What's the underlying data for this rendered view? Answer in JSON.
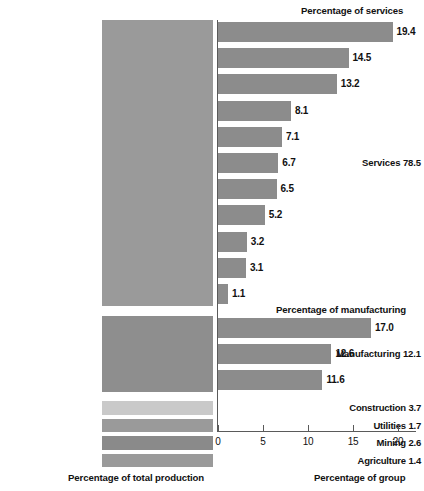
{
  "chart_data": {
    "type": "bar",
    "title": "",
    "orientation": "horizontal",
    "xlabel": "Percentage of group",
    "ylabel": "",
    "xlim": [
      0,
      22
    ],
    "xticks": [
      0,
      5,
      10,
      15,
      20
    ],
    "xtick_labels": [
      "0",
      "5",
      "10",
      "15",
      "20"
    ],
    "grid": false,
    "legend": false,
    "left_axis_title": "Percentage of total production",
    "right_axis_title": "Percentage of group",
    "sections": [
      {
        "name": "Services",
        "total": 78.5,
        "total_label": "Services 78.5",
        "header": "Percentage of services",
        "categories": [
          "Healthcare",
          "Real estate",
          "Professional and\nbusiness services",
          "Finance and insurance",
          "Education",
          "Wholesale trade",
          "Retail trade",
          "Information",
          "Transportation",
          "Accommodation\nand food services",
          "Arts, entertainment,\nand recreation"
        ],
        "values": [
          19.4,
          14.5,
          13.2,
          8.1,
          7.1,
          6.7,
          6.5,
          5.2,
          3.2,
          3.1,
          1.1
        ],
        "value_labels": [
          "19.4",
          "14.5",
          "13.2",
          "8.1",
          "7.1",
          "6.7",
          "6.5",
          "5.2",
          "3.2",
          "3.1",
          "1.1"
        ]
      },
      {
        "name": "Manufacturing",
        "total": 12.1,
        "total_label": "Manufacturing 12.1",
        "header": "Percentage of manufacturing",
        "categories": [
          "Chemicals",
          "Computers",
          "Food and drink"
        ],
        "values": [
          17.0,
          12.6,
          11.6
        ],
        "value_labels": [
          "17.0",
          "12.6",
          "11.6"
        ]
      }
    ],
    "solo_rows": [
      {
        "label": "Construction 3.7",
        "name": "Construction",
        "value": 3.7,
        "color": "#c9c9c9"
      },
      {
        "label": "Utilities 1.7",
        "name": "Utilities",
        "value": 1.7,
        "color": "#9a9a9a"
      },
      {
        "label": "Mining 2.6",
        "name": "Mining",
        "value": 2.6,
        "color": "#8a8a8a"
      },
      {
        "label": "Agriculture 1.4",
        "name": "Agriculture",
        "value": 1.4,
        "color": "#9a9a9a"
      }
    ],
    "colors": {
      "services_block": "#9a9a9a",
      "manufacturing_block": "#8e8e8e",
      "bar": "#8c8c8c",
      "axis": "#5a5a5a",
      "text": "#111111",
      "category_text": "#ffffff"
    }
  }
}
